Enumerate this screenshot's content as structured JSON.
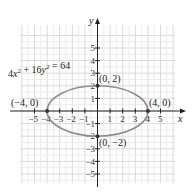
{
  "chart_data": {
    "type": "line",
    "title": "",
    "equation": "4x² + 16y² = 64",
    "xlabel": "x",
    "ylabel": "y",
    "xlim": [
      -6,
      6
    ],
    "ylim": [
      -6,
      6
    ],
    "grid": true,
    "x_ticks": [
      "-5",
      "-4",
      "-3",
      "-2",
      "-1",
      "1",
      "2",
      "3",
      "4",
      "5"
    ],
    "y_ticks": [
      "5",
      "4",
      "3",
      "2",
      "1",
      "-1",
      "-2",
      "-3",
      "-4",
      "-5"
    ],
    "series": [
      {
        "name": "ellipse 4x² + 16y² = 64",
        "shape": "ellipse",
        "center": [
          0,
          0
        ],
        "semi_major_x": 4,
        "semi_minor_y": 2,
        "color": "#8a8a8a"
      }
    ],
    "points": [
      {
        "label": "(0, 2)",
        "x": 0,
        "y": 2
      },
      {
        "label": "(0, −2)",
        "x": 0,
        "y": -2
      },
      {
        "label": "(−4, 0)",
        "x": -4,
        "y": 0
      },
      {
        "label": "(4, 0)",
        "x": 4,
        "y": 0
      }
    ]
  },
  "labels": {
    "equation": "4x² + 16y² = 64",
    "x_axis": "x",
    "y_axis": "y",
    "p_top": "(0, 2)",
    "p_bottom": "(0, −2)",
    "p_left": "(−4, 0)",
    "p_right": "(4, 0)",
    "xt": [
      "−5",
      "−4",
      "−3",
      "−2",
      "−1",
      "1",
      "2",
      "3",
      "4",
      "5"
    ],
    "yt": [
      "5",
      "4",
      "3",
      "2",
      "1",
      "−1",
      "−2",
      "−3",
      "−4",
      "−5"
    ]
  }
}
